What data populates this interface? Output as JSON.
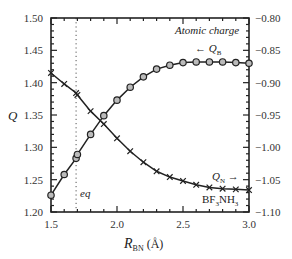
{
  "chart_data": {
    "type": "line",
    "title": "Atomic charge",
    "xlabel": "R_BN (Å)",
    "xlabel_main": "R",
    "xlabel_sub": "BN",
    "xlabel_unit": " (Å)",
    "ylabel": "Q",
    "xlim": [
      1.5,
      3.0
    ],
    "ylim_left": [
      1.2,
      1.5
    ],
    "ylim_right": [
      -1.1,
      -0.8
    ],
    "x_ticks": [
      "1.5",
      "2.0",
      "2.5",
      "3.0"
    ],
    "x_tick_values": [
      1.5,
      2.0,
      2.5,
      3.0
    ],
    "y_ticks_left": [
      "1.20",
      "1.25",
      "1.30",
      "1.35",
      "1.40",
      "1.45",
      "1.50"
    ],
    "y_tick_values_left": [
      1.2,
      1.25,
      1.3,
      1.35,
      1.4,
      1.45,
      1.5
    ],
    "y_ticks_right": [
      "−1.10",
      "−1.05",
      "−1.00",
      "−0.95",
      "−0.90",
      "−0.85",
      "−0.80"
    ],
    "y_tick_values_right": [
      -1.1,
      -1.05,
      -1.0,
      -0.95,
      -0.9,
      -0.85,
      -0.8
    ],
    "grid": false,
    "equilibrium": {
      "label": "eq",
      "x": 1.69
    },
    "annotations": {
      "title_text": "Atomic charge",
      "qb_label": "← Q",
      "qb_sub": "B",
      "qn_label": "Q",
      "qn_sub": "N",
      "qn_arrow": " →",
      "molecule": "BF3NH3"
    },
    "series": [
      {
        "name": "Q_B",
        "axis": "left",
        "marker": "circle",
        "x": [
          1.5,
          1.6,
          1.69,
          1.7,
          1.8,
          1.9,
          2.0,
          2.1,
          2.2,
          2.3,
          2.4,
          2.5,
          2.6,
          2.7,
          2.8,
          2.9,
          3.0
        ],
        "values": [
          1.226,
          1.258,
          1.283,
          1.289,
          1.32,
          1.349,
          1.373,
          1.393,
          1.409,
          1.421,
          1.427,
          1.431,
          1.432,
          1.432,
          1.432,
          1.431,
          1.43
        ]
      },
      {
        "name": "Q_N",
        "axis": "right",
        "marker": "cross",
        "x": [
          1.5,
          1.6,
          1.69,
          1.7,
          1.8,
          1.9,
          2.0,
          2.1,
          2.2,
          2.3,
          2.4,
          2.5,
          2.6,
          2.7,
          2.8,
          2.9,
          3.0
        ],
        "values": [
          -0.885,
          -0.902,
          -0.916,
          -0.919,
          -0.944,
          -0.964,
          -0.986,
          -1.006,
          -1.023,
          -1.037,
          -1.046,
          -1.052,
          -1.058,
          -1.062,
          -1.064,
          -1.065,
          -1.066
        ]
      }
    ]
  }
}
